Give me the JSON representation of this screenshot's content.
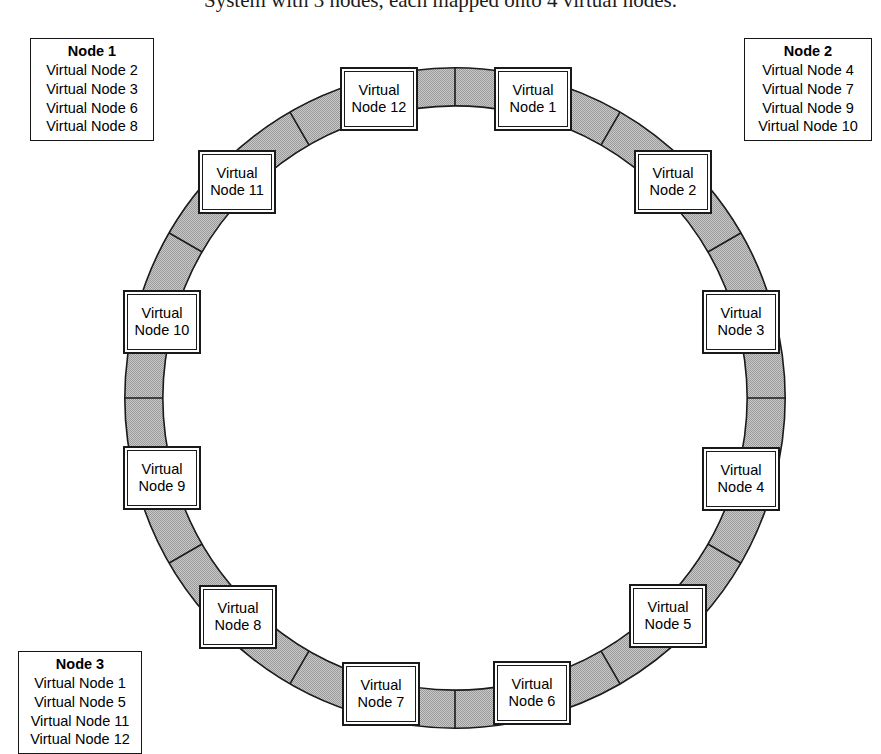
{
  "caption": {
    "text": "System with 3 nodes, each mapped onto 4 virtual nodes."
  },
  "ring": {
    "center_x": 455,
    "center_y": 398,
    "outer_radius": 330,
    "inner_radius": 292,
    "band_color": "#b3b3b3",
    "band_stroke": "#1a1a1a",
    "segment_count": 12,
    "start_angle_deg": -75
  },
  "virtual_nodes": [
    {
      "id": 1,
      "line1": "Virtual",
      "line2": "Node 1",
      "angle_deg": -75,
      "x": 533,
      "y": 99
    },
    {
      "id": 2,
      "line1": "Virtual",
      "line2": "Node 2",
      "angle_deg": -45,
      "x": 673,
      "y": 182
    },
    {
      "id": 3,
      "line1": "Virtual",
      "line2": "Node 3",
      "angle_deg": -15,
      "x": 741,
      "y": 322
    },
    {
      "id": 4,
      "line1": "Virtual",
      "line2": "Node 4",
      "angle_deg": 15,
      "x": 741,
      "y": 479
    },
    {
      "id": 5,
      "line1": "Virtual",
      "line2": "Node 5",
      "angle_deg": 45,
      "x": 668,
      "y": 616
    },
    {
      "id": 6,
      "line1": "Virtual",
      "line2": "Node 6",
      "angle_deg": 75,
      "x": 532,
      "y": 693
    },
    {
      "id": 7,
      "line1": "Virtual",
      "line2": "Node 7",
      "angle_deg": 105,
      "x": 381,
      "y": 694
    },
    {
      "id": 8,
      "line1": "Virtual",
      "line2": "Node 8",
      "angle_deg": 135,
      "x": 238,
      "y": 617
    },
    {
      "id": 9,
      "line1": "Virtual",
      "line2": "Node 9",
      "angle_deg": 165,
      "x": 162,
      "y": 478
    },
    {
      "id": 10,
      "line1": "Virtual",
      "line2": "Node 10",
      "angle_deg": 195,
      "x": 162,
      "y": 322
    },
    {
      "id": 11,
      "line1": "Virtual",
      "line2": "Node 11",
      "angle_deg": 225,
      "x": 237,
      "y": 182
    },
    {
      "id": 12,
      "line1": "Virtual",
      "line2": "Node 12",
      "angle_deg": 255,
      "x": 379,
      "y": 99
    }
  ],
  "legends": [
    {
      "title": "Node 1",
      "items": [
        "Virtual Node 2",
        "Virtual Node 3",
        "Virtual Node 6",
        "Virtual Node 8"
      ]
    },
    {
      "title": "Node 2",
      "items": [
        "Virtual Node 4",
        "Virtual Node 7",
        "Virtual Node 9",
        "Virtual Node 10"
      ]
    },
    {
      "title": "Node 3",
      "items": [
        "Virtual Node 1",
        "Virtual Node 5",
        "Virtual Node 11",
        "Virtual Node 12"
      ]
    }
  ]
}
